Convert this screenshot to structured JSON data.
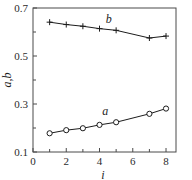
{
  "chart_data": {
    "type": "scatter",
    "title": "",
    "xlabel": "i",
    "ylabel": "a,b",
    "xlim": [
      0,
      8.6
    ],
    "ylim": [
      0.1,
      0.7
    ],
    "grid": false,
    "legend": "inline-labels",
    "xticks": [
      0,
      2,
      4,
      6,
      8
    ],
    "xtick_labels": [
      "0",
      "2",
      "4",
      "6",
      "8"
    ],
    "xticks_minor": [
      1,
      3,
      5,
      7
    ],
    "yticks": [
      0.1,
      0.3,
      0.5,
      0.7
    ],
    "ytick_labels": [
      "0.1",
      "0.3",
      "0.5",
      "0.7"
    ],
    "yticks_minor": [
      0.2,
      0.4,
      0.6
    ],
    "series": [
      {
        "name": "b",
        "marker": "plus",
        "label": "b",
        "x": [
          1,
          2,
          3,
          4,
          5,
          7,
          8
        ],
        "values": [
          0.641,
          0.631,
          0.624,
          0.614,
          0.607,
          0.575,
          0.583
        ]
      },
      {
        "name": "a",
        "marker": "circle",
        "label": "a",
        "x": [
          1,
          2,
          3,
          4,
          5,
          7,
          8
        ],
        "values": [
          0.178,
          0.191,
          0.199,
          0.213,
          0.224,
          0.259,
          0.281
        ]
      }
    ]
  },
  "axes": {
    "y_title": "a,b",
    "x_title": "i"
  },
  "colors": {
    "line": "#1c1c1c",
    "frame": "#4a4a4a",
    "text": "#2b2b2b",
    "background": "#ffffff"
  }
}
